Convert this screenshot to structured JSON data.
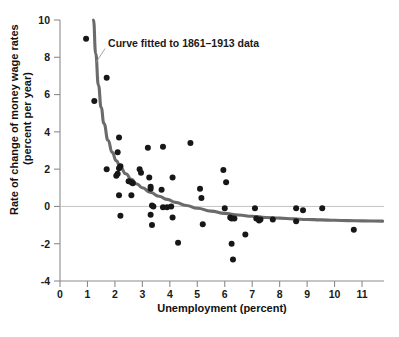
{
  "chart_data": {
    "type": "scatter",
    "title": "",
    "xlabel": "Unemployment (percent)",
    "ylabel": "Rate of change of money wage rates (percent per year)",
    "ylabel_line1": "Rate of change of money wage rates",
    "ylabel_line2": "(percent per year)",
    "xlim": [
      0,
      11.8
    ],
    "ylim": [
      -4,
      10
    ],
    "xticks": [
      0,
      1,
      2,
      3,
      4,
      5,
      6,
      7,
      8,
      9,
      10,
      11
    ],
    "xticklabels": [
      "0",
      "1",
      "2",
      "3",
      "4",
      "5",
      "6",
      "7",
      "8",
      "9",
      "10",
      "11"
    ],
    "yticks": [
      -4,
      -2,
      0,
      2,
      4,
      6,
      8,
      10
    ],
    "yticklabels": [
      "-4",
      "-2",
      "0",
      "2",
      "4",
      "6",
      "8",
      "10"
    ],
    "grid": false,
    "zero_line": true,
    "legend": null,
    "annotations": [
      {
        "text": "Curve fitted to 1861–1913 data",
        "x": 1.75,
        "y": 8.55,
        "leader_to_x": 1.3,
        "leader_to_y": 7.7
      }
    ],
    "series": [
      {
        "name": "Annual observations",
        "type": "scatter",
        "marker": "circle",
        "color": "#171717",
        "points": [
          [
            0.95,
            9.0
          ],
          [
            1.25,
            5.65
          ],
          [
            1.7,
            6.9
          ],
          [
            1.7,
            2.0
          ],
          [
            2.15,
            3.7
          ],
          [
            2.1,
            2.9
          ],
          [
            2.1,
            1.75
          ],
          [
            2.05,
            1.65
          ],
          [
            2.2,
            2.15
          ],
          [
            2.15,
            2.05
          ],
          [
            2.15,
            0.6
          ],
          [
            2.2,
            -0.5
          ],
          [
            2.5,
            1.35
          ],
          [
            2.6,
            1.3
          ],
          [
            2.65,
            1.25
          ],
          [
            2.6,
            0.6
          ],
          [
            2.9,
            2.0
          ],
          [
            2.95,
            1.8
          ],
          [
            3.2,
            3.15
          ],
          [
            3.25,
            1.55
          ],
          [
            3.3,
            0.95
          ],
          [
            3.3,
            1.05
          ],
          [
            3.35,
            0.05
          ],
          [
            3.4,
            0.0
          ],
          [
            3.3,
            -0.45
          ],
          [
            3.35,
            -1.0
          ],
          [
            3.75,
            3.2
          ],
          [
            3.7,
            0.9
          ],
          [
            3.75,
            -0.05
          ],
          [
            3.9,
            -0.05
          ],
          [
            4.05,
            0.0
          ],
          [
            4.1,
            1.55
          ],
          [
            4.1,
            -0.6
          ],
          [
            4.3,
            -1.95
          ],
          [
            4.75,
            3.4
          ],
          [
            5.1,
            0.95
          ],
          [
            5.15,
            0.45
          ],
          [
            5.2,
            -0.95
          ],
          [
            5.95,
            1.95
          ],
          [
            6.0,
            -0.1
          ],
          [
            6.05,
            1.3
          ],
          [
            6.2,
            -0.6
          ],
          [
            6.25,
            -0.65
          ],
          [
            6.35,
            -0.65
          ],
          [
            6.25,
            -2.0
          ],
          [
            6.3,
            -2.85
          ],
          [
            6.75,
            -1.5
          ],
          [
            7.1,
            -0.1
          ],
          [
            7.15,
            -0.65
          ],
          [
            7.25,
            -0.75
          ],
          [
            7.3,
            -0.7
          ],
          [
            7.75,
            -0.7
          ],
          [
            8.6,
            -0.1
          ],
          [
            8.6,
            -0.8
          ],
          [
            8.85,
            -0.2
          ],
          [
            9.55,
            -0.1
          ],
          [
            10.7,
            -1.25
          ]
        ]
      }
    ],
    "fitted_curve": {
      "name": "Curve fitted to 1861-1913 data",
      "color": "#6b6b6b",
      "x_start": 1.22,
      "x_end": 11.75,
      "points": [
        [
          1.22,
          10.0
        ],
        [
          1.3,
          8.2
        ],
        [
          1.4,
          6.5
        ],
        [
          1.5,
          5.3
        ],
        [
          1.6,
          4.45
        ],
        [
          1.75,
          3.55
        ],
        [
          1.9,
          2.9
        ],
        [
          2.05,
          2.45
        ],
        [
          2.2,
          2.1
        ],
        [
          2.4,
          1.75
        ],
        [
          2.6,
          1.45
        ],
        [
          2.8,
          1.2
        ],
        [
          3.0,
          1.0
        ],
        [
          3.3,
          0.75
        ],
        [
          3.6,
          0.55
        ],
        [
          3.9,
          0.38
        ],
        [
          4.2,
          0.22
        ],
        [
          4.6,
          0.05
        ],
        [
          5.0,
          -0.1
        ],
        [
          5.5,
          -0.25
        ],
        [
          6.0,
          -0.37
        ],
        [
          6.5,
          -0.46
        ],
        [
          7.0,
          -0.53
        ],
        [
          7.5,
          -0.59
        ],
        [
          8.0,
          -0.63
        ],
        [
          8.5,
          -0.67
        ],
        [
          9.0,
          -0.7
        ],
        [
          9.5,
          -0.72
        ],
        [
          10.0,
          -0.745
        ],
        [
          10.5,
          -0.76
        ],
        [
          11.0,
          -0.775
        ],
        [
          11.75,
          -0.79
        ]
      ]
    }
  },
  "caption": {
    "text": ""
  }
}
